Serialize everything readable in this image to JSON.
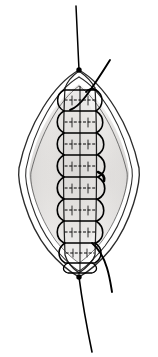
{
  "figure": {
    "domain_label": "surgical-technique-illustration",
    "canvas": {
      "width": 158,
      "height": 357,
      "background": "#ffffff"
    },
    "alt_text": "Line drawing of a lens-shaped (elliptical) surgical wound closed by a continuous spiral running suture, with a knot and thread tail at the upper apex and a knot with thread tail at the lower apex; two curved suture strands exit toward the right."
  },
  "colors": {
    "ink": "#1a1a1a",
    "thread": "#000000",
    "outline": "#2b2b2b",
    "tissue_fill": "#e8e6e4",
    "tissue_fill_light": "#f3f2f1",
    "tissue_shadow": "#cfcdcb",
    "inner_wall": "#ffffff",
    "background": "#ffffff"
  },
  "geometry": {
    "wound": {
      "shape": "lens",
      "apex_top": {
        "x": 79,
        "y": 70
      },
      "apex_bottom": {
        "x": 79,
        "y": 277
      },
      "left_extreme_x": 18,
      "right_extreme_x": 140,
      "outer_outline_count": 2,
      "inner_outline_count": 2
    },
    "suture": {
      "type": "continuous-running-spiral",
      "loop_count": 9,
      "loop_top_y": 90,
      "loop_bottom_y": 266,
      "loop_pitch": 22,
      "loop_width": 34,
      "center_x": 80,
      "dashed_cross_marks": true
    },
    "threads": [
      {
        "name": "top-tail",
        "from": {
          "x": 79,
          "y": 70
        },
        "to": {
          "x": 76,
          "y": 6
        },
        "style": "straight"
      },
      {
        "name": "top-right-curved-strand",
        "from": {
          "x": 79,
          "y": 70
        },
        "to": {
          "x": 110,
          "y": 60
        },
        "style": "curved"
      },
      {
        "name": "bottom-right-curved-strand",
        "from": {
          "x": 96,
          "y": 252
        },
        "to": {
          "x": 112,
          "y": 290
        },
        "style": "curved"
      },
      {
        "name": "bottom-tail",
        "from": {
          "x": 79,
          "y": 277
        },
        "to": {
          "x": 92,
          "y": 352
        },
        "style": "straight"
      }
    ],
    "knots": [
      {
        "name": "top-knot",
        "x": 79,
        "y": 70,
        "radius": 2.6
      },
      {
        "name": "bottom-knot",
        "x": 79,
        "y": 277,
        "radius": 2.6
      }
    ]
  },
  "labels": {
    "top_thread": "",
    "bottom_thread": "",
    "annotations": []
  }
}
